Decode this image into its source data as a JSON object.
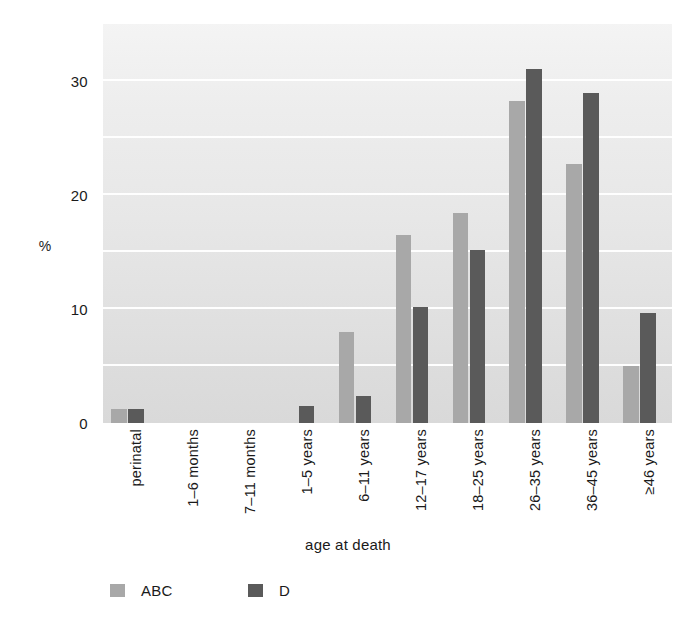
{
  "chart_data": {
    "type": "bar",
    "title": "",
    "xlabel": "age at death",
    "ylabel": "%",
    "categories": [
      "perinatal",
      "1–6 months",
      "7–11 months",
      "1–5 years",
      "6–11 years",
      "12–17 years",
      "18–25 years",
      "26–35 years",
      "36–45 years",
      "≥46 years"
    ],
    "series": [
      {
        "name": "ABC",
        "color": "#a8a8a8",
        "values": [
          1.2,
          0,
          0,
          0,
          8.0,
          16.5,
          18.4,
          28.3,
          22.7,
          5.0
        ]
      },
      {
        "name": "D",
        "color": "#5a5a5a",
        "values": [
          1.2,
          0,
          0,
          1.5,
          2.4,
          10.2,
          15.2,
          31.1,
          29.0,
          9.7
        ]
      }
    ],
    "ylim": [
      0,
      35.2
    ],
    "yticks": [
      0,
      10,
      20,
      30
    ],
    "ytick_labels": [
      "0",
      "10",
      "20",
      "30"
    ],
    "gridlines": [
      5,
      10,
      15,
      20,
      25,
      30,
      35
    ],
    "grid": true,
    "grid_color": "#ffffff",
    "legend_position": "bottom-left",
    "plot_background": "#e8e8e8"
  },
  "legend": {
    "items": [
      {
        "label": "ABC",
        "color": "#a8a8a8"
      },
      {
        "label": "D",
        "color": "#5a5a5a"
      }
    ]
  },
  "axes": {
    "y_title": "%",
    "x_title": "age at death"
  }
}
